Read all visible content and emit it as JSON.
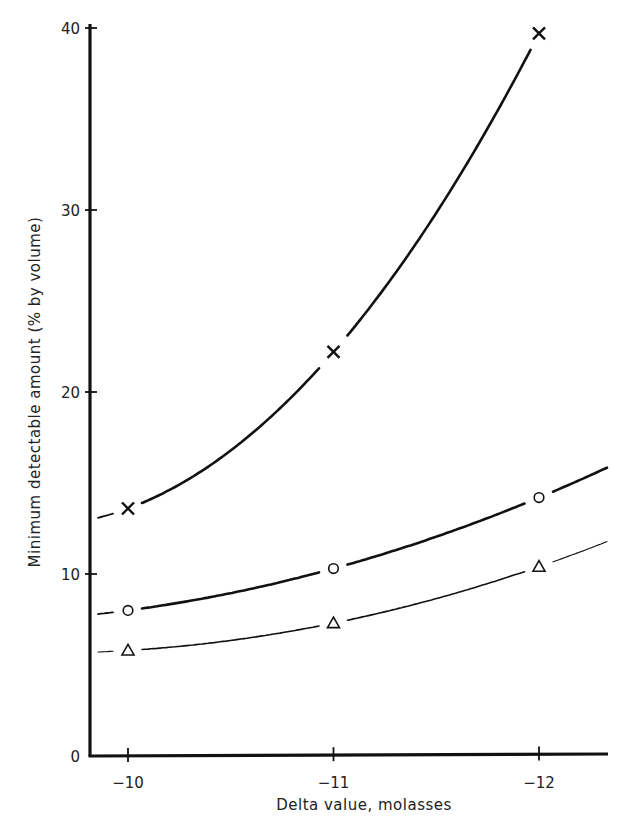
{
  "chart_data": {
    "type": "line",
    "title": "",
    "xlabel": "Delta value, molasses",
    "ylabel": "Minimum detectable amount (% by volume)",
    "x": [
      -10,
      -11,
      -12
    ],
    "x_tick_labels": [
      "−10",
      "−11",
      "−12"
    ],
    "y_ticks": [
      0,
      10,
      20,
      30,
      40
    ],
    "y_tick_labels": [
      "0",
      "10",
      "20",
      "30",
      "40"
    ],
    "ylim": [
      0,
      40
    ],
    "xlim": [
      -9.8,
      -12.2
    ],
    "grid": false,
    "legend": null,
    "series": [
      {
        "name": "cross",
        "marker": "x",
        "line_width": 2.6,
        "values": [
          13.6,
          22.2,
          39.7
        ]
      },
      {
        "name": "circle",
        "marker": "o",
        "line_width": 2.6,
        "values": [
          8.0,
          10.3,
          14.2
        ]
      },
      {
        "name": "triangle",
        "marker": "triangle",
        "line_width": 1.6,
        "values": [
          5.8,
          7.3,
          10.4
        ]
      }
    ]
  },
  "colors": {
    "ink": "#111111",
    "background": "#ffffff"
  }
}
